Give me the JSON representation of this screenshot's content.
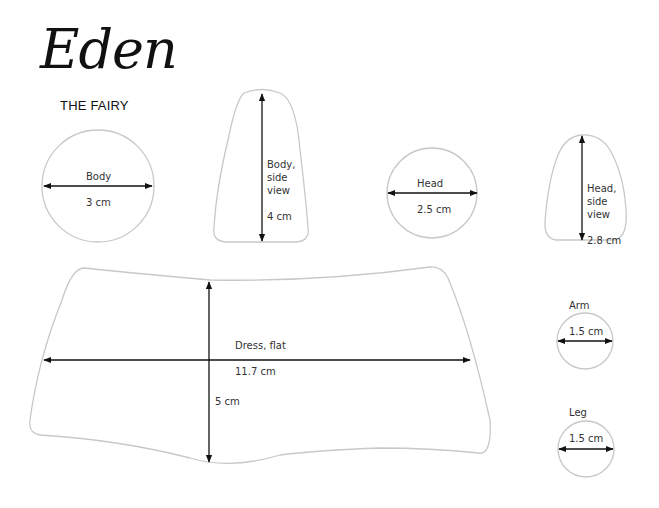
{
  "header": {
    "title": "Eden",
    "subtitle": "THE FAIRY"
  },
  "colors": {
    "outline": "#c8c8c8",
    "arrow": "#111111",
    "text": "#333333"
  },
  "pieces": {
    "body": {
      "name": "Body",
      "measure": "3 cm"
    },
    "body_side": {
      "name": "Body,\nside\nview",
      "measure": "4 cm"
    },
    "head": {
      "name": "Head",
      "measure": "2.5 cm"
    },
    "head_side": {
      "name": "Head,\nside\nview",
      "measure": "2.8 cm"
    },
    "dress": {
      "name": "Dress, flat",
      "width": "11.7 cm",
      "height": "5 cm"
    },
    "arm": {
      "name": "Arm",
      "measure": "1.5 cm"
    },
    "leg": {
      "name": "Leg",
      "measure": "1.5 cm"
    }
  }
}
